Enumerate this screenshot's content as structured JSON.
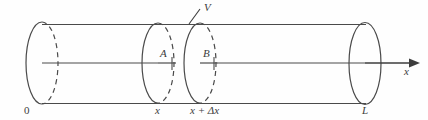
{
  "figure": {
    "type": "diagram",
    "background_color": "#fefefe",
    "line_color": "#4a4a4a",
    "label_color": "#3c3c3c"
  },
  "geometry": {
    "cylinder": {
      "top_line_y": 25,
      "bottom_line_y": 103,
      "axis_y": 63,
      "left_end_x": 42,
      "right_end_x": 365,
      "ellipse_rx": 16,
      "ellipse_ry": 41
    },
    "cross_sections": [
      {
        "id": "left-cap",
        "center_x": 42,
        "label": "0",
        "dashed_back_half": true
      },
      {
        "id": "disc-a",
        "center_x": 158,
        "label": "x",
        "dashed_back_half": true
      },
      {
        "id": "disc-b",
        "center_x": 200,
        "label": "x + Δx",
        "dashed_back_half": true
      },
      {
        "id": "right-cap",
        "center_x": 365,
        "label": "L",
        "dashed_back_half": false
      }
    ],
    "axis_arrow": {
      "start_x": 365,
      "end_x": 420,
      "y": 63
    }
  },
  "labels": {
    "volume": "V",
    "section_a": "A",
    "section_b": "B",
    "axis": "x",
    "position_origin": "0",
    "position_x": "x",
    "position_x_plus_dx": "x + Δx",
    "position_length": "L"
  }
}
